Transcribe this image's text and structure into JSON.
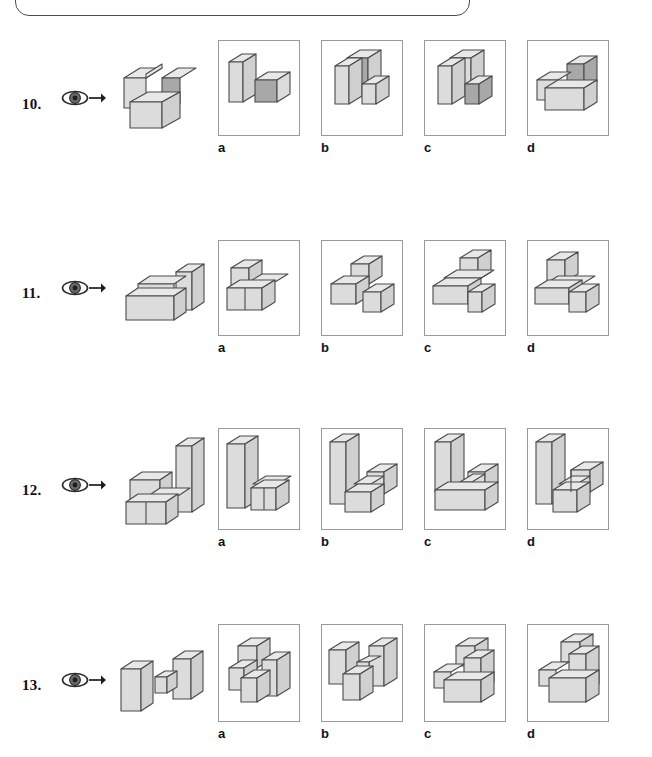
{
  "page": {
    "kind": "spatial-reasoning-cube-rotation-worksheet",
    "top_partial_box": "",
    "colors": {
      "top_face": "#e8e8e8",
      "front_face": "#dcdcdc",
      "side_face": "#d0d0d0",
      "accent_face": "#a8a8a8",
      "outline": "#4a4a4a",
      "frame_border": "#9a9a9a",
      "text": "#111111",
      "eye_iris": "#6b6b6b",
      "eye_pupil": "#2b2b2b"
    },
    "option_letters": [
      "a",
      "b",
      "c",
      "d"
    ],
    "icons": {
      "eye": "eye-icon",
      "arrow": "arrow-right-icon"
    }
  },
  "questions": [
    {
      "number": "10.",
      "prompt_figure": "L-shaped 3-cube solid with one dark shaded face",
      "options": [
        {
          "letter": "a",
          "figure": "stepped solid, tall block left, low blocks right with dark front face"
        },
        {
          "letter": "b",
          "figure": "two tall blocks with dark inner face, low block front-right"
        },
        {
          "letter": "c",
          "figure": "two tall blocks, low block front-right with dark front face"
        },
        {
          "letter": "d",
          "figure": "low L solid with tall block right having dark side face"
        }
      ]
    },
    {
      "number": "11.",
      "prompt_figure": "stepped solid: long low bar with raised block at right",
      "options": [
        {
          "letter": "a",
          "figure": "cube on left end of a long bar angled right"
        },
        {
          "letter": "b",
          "figure": "T arrangement, cube raised on centre of bar"
        },
        {
          "letter": "c",
          "figure": "cube raised behind centre of long crossing bar"
        },
        {
          "letter": "d",
          "figure": "cube raised on left of long bar with block at right end"
        }
      ]
    },
    {
      "number": "12.",
      "prompt_figure": "two low cubes with a tall column behind right",
      "options": [
        {
          "letter": "a",
          "figure": "tall column at left, two low cubes to the right"
        },
        {
          "letter": "b",
          "figure": "tall column at left, low bar with raised cube right"
        },
        {
          "letter": "c",
          "figure": "tall column left, low slab with small cube right"
        },
        {
          "letter": "d",
          "figure": "tall column left, stepped low blocks to the right"
        }
      ]
    },
    {
      "number": "13.",
      "prompt_figure": "dumbbell: two upright slabs joined by a thin connector",
      "options": [
        {
          "letter": "a",
          "figure": "cube raised top-left with blocks lower right"
        },
        {
          "letter": "b",
          "figure": "two upright slabs with low cube between them"
        },
        {
          "letter": "c",
          "figure": "raised cube behind, upright slab right on low L base"
        },
        {
          "letter": "d",
          "figure": "raised cube behind, tall slab right on low L base"
        }
      ]
    }
  ]
}
